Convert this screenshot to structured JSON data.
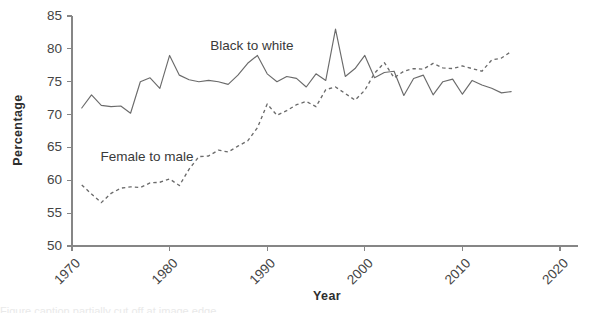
{
  "figure": {
    "background": "#ffffff",
    "line_color": "#6b6b6b",
    "axis_color": "#868686",
    "text_color": "#3d3d3d"
  },
  "axes": {
    "y_title": "Percentage",
    "x_title": "Year",
    "y_ticks": [
      "50",
      "55",
      "60",
      "65",
      "70",
      "75",
      "80",
      "85"
    ],
    "x_ticks": [
      "1970",
      "1980",
      "1990",
      "2000",
      "2010",
      "2020"
    ]
  },
  "labels": {
    "series_black_to_white": "Black to white",
    "series_female_to_male": "Female to male"
  },
  "caption": {
    "cut_off_text": "Figure caption partially cut off at image edge"
  },
  "chart_data": {
    "type": "line",
    "title": "",
    "xlabel": "Year",
    "ylabel": "Percentage",
    "xlim": [
      1970,
      2020
    ],
    "ylim": [
      50,
      85
    ],
    "grid": false,
    "legend": "inline annotations",
    "series": [
      {
        "name": "Black to white",
        "style": "solid",
        "annotation": "Black to white",
        "x": [
          1971,
          1972,
          1973,
          1974,
          1975,
          1976,
          1977,
          1978,
          1979,
          1980,
          1981,
          1982,
          1983,
          1984,
          1985,
          1986,
          1987,
          1988,
          1989,
          1990,
          1991,
          1992,
          1993,
          1994,
          1995,
          1996,
          1997,
          1998,
          1999,
          2000,
          2001,
          2002,
          2003,
          2004,
          2005,
          2006,
          2007,
          2008,
          2009,
          2010,
          2011,
          2012,
          2013,
          2014,
          2015
        ],
        "values": [
          71.0,
          73.0,
          71.4,
          71.2,
          71.3,
          70.2,
          75.0,
          75.6,
          74.0,
          79.0,
          76.0,
          75.3,
          75.0,
          75.2,
          75.0,
          74.6,
          76.0,
          77.8,
          79.0,
          76.2,
          75.0,
          75.8,
          75.5,
          74.2,
          76.2,
          75.2,
          83.0,
          75.8,
          77.0,
          79.0,
          75.6,
          76.4,
          76.6,
          72.9,
          75.5,
          76.0,
          73.0,
          75.0,
          75.4,
          73.1,
          75.2,
          74.5,
          74.0,
          73.3,
          73.5
        ]
      },
      {
        "name": "Female to male",
        "style": "dashed",
        "annotation": "Female to male",
        "x": [
          1971,
          1972,
          1973,
          1974,
          1975,
          1976,
          1977,
          1978,
          1979,
          1980,
          1981,
          1982,
          1983,
          1984,
          1985,
          1986,
          1987,
          1988,
          1989,
          1990,
          1991,
          1992,
          1993,
          1994,
          1995,
          1996,
          1997,
          1998,
          1999,
          2000,
          2001,
          2002,
          2003,
          2004,
          2005,
          2006,
          2007,
          2008,
          2009,
          2010,
          2011,
          2012,
          2013,
          2014,
          2015
        ],
        "values": [
          59.3,
          57.9,
          56.6,
          58.0,
          58.8,
          59.0,
          58.9,
          59.6,
          59.7,
          60.2,
          59.2,
          61.7,
          63.6,
          63.7,
          64.6,
          64.3,
          65.2,
          66.0,
          68.0,
          71.6,
          69.9,
          70.6,
          71.5,
          72.0,
          71.2,
          73.8,
          74.2,
          73.2,
          72.2,
          73.7,
          76.3,
          77.9,
          75.6,
          76.6,
          77.0,
          76.9,
          77.8,
          77.1,
          77.0,
          77.4,
          77.0,
          76.6,
          78.3,
          78.6,
          79.6
        ]
      }
    ]
  }
}
